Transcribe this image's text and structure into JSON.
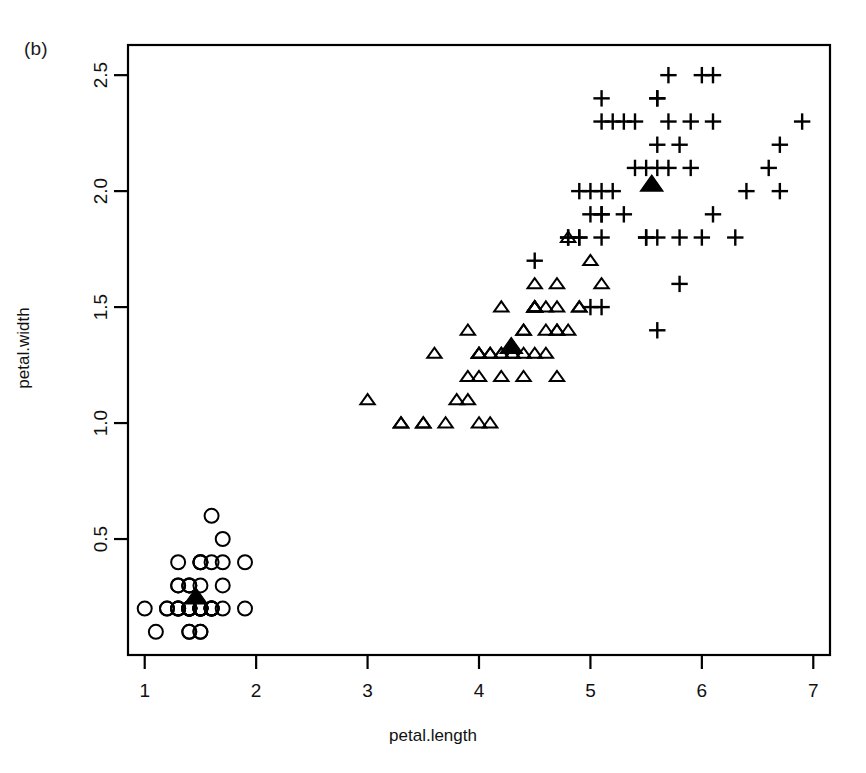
{
  "figure": {
    "panel_label": "(b)",
    "background_color": "#ffffff",
    "foreground_color": "#000000"
  },
  "chart_data": {
    "type": "scatter",
    "title": "",
    "subtitle": "",
    "panel_label": "(b)",
    "xlabel": "petal.length",
    "ylabel": "petal.width",
    "xlim": [
      0.85,
      7.15
    ],
    "ylim": [
      0.0,
      2.63
    ],
    "xticks": [
      1,
      2,
      3,
      4,
      5,
      6,
      7
    ],
    "xtick_labels": [
      "1",
      "2",
      "3",
      "4",
      "5",
      "6",
      "7"
    ],
    "yticks": [
      0.5,
      1.0,
      1.5,
      2.0,
      2.5
    ],
    "ytick_labels": [
      "0.5",
      "1.0",
      "1.5",
      "2.0",
      "2.5"
    ],
    "grid": false,
    "legend": false,
    "legend_position": "none",
    "frame": "box",
    "series": [
      {
        "name": "setosa",
        "marker": "circle-open",
        "color": "#000000",
        "points": [
          [
            1.4,
            0.2
          ],
          [
            1.4,
            0.2
          ],
          [
            1.3,
            0.2
          ],
          [
            1.5,
            0.2
          ],
          [
            1.4,
            0.2
          ],
          [
            1.7,
            0.4
          ],
          [
            1.4,
            0.3
          ],
          [
            1.5,
            0.2
          ],
          [
            1.4,
            0.2
          ],
          [
            1.5,
            0.1
          ],
          [
            1.5,
            0.2
          ],
          [
            1.6,
            0.2
          ],
          [
            1.4,
            0.1
          ],
          [
            1.1,
            0.1
          ],
          [
            1.2,
            0.2
          ],
          [
            1.5,
            0.4
          ],
          [
            1.3,
            0.4
          ],
          [
            1.4,
            0.3
          ],
          [
            1.7,
            0.3
          ],
          [
            1.5,
            0.3
          ],
          [
            1.7,
            0.2
          ],
          [
            1.5,
            0.4
          ],
          [
            1.0,
            0.2
          ],
          [
            1.7,
            0.5
          ],
          [
            1.9,
            0.2
          ],
          [
            1.6,
            0.2
          ],
          [
            1.6,
            0.4
          ],
          [
            1.5,
            0.2
          ],
          [
            1.4,
            0.2
          ],
          [
            1.6,
            0.2
          ],
          [
            1.6,
            0.2
          ],
          [
            1.5,
            0.4
          ],
          [
            1.5,
            0.1
          ],
          [
            1.4,
            0.2
          ],
          [
            1.5,
            0.2
          ],
          [
            1.2,
            0.2
          ],
          [
            1.3,
            0.2
          ],
          [
            1.4,
            0.1
          ],
          [
            1.3,
            0.2
          ],
          [
            1.5,
            0.2
          ],
          [
            1.3,
            0.3
          ],
          [
            1.3,
            0.3
          ],
          [
            1.3,
            0.2
          ],
          [
            1.6,
            0.6
          ],
          [
            1.9,
            0.4
          ],
          [
            1.4,
            0.3
          ],
          [
            1.6,
            0.2
          ],
          [
            1.4,
            0.2
          ],
          [
            1.5,
            0.2
          ],
          [
            1.4,
            0.2
          ]
        ],
        "centroid": [
          1.46,
          0.25
        ],
        "centroid_marker": "triangle-filled"
      },
      {
        "name": "versicolor",
        "marker": "triangle-open",
        "color": "#000000",
        "points": [
          [
            4.7,
            1.4
          ],
          [
            4.5,
            1.5
          ],
          [
            4.9,
            1.5
          ],
          [
            4.0,
            1.3
          ],
          [
            4.6,
            1.5
          ],
          [
            4.5,
            1.3
          ],
          [
            4.7,
            1.6
          ],
          [
            3.3,
            1.0
          ],
          [
            4.6,
            1.3
          ],
          [
            3.9,
            1.4
          ],
          [
            3.5,
            1.0
          ],
          [
            4.2,
            1.5
          ],
          [
            4.0,
            1.0
          ],
          [
            4.7,
            1.4
          ],
          [
            3.6,
            1.3
          ],
          [
            4.4,
            1.4
          ],
          [
            4.5,
            1.5
          ],
          [
            4.1,
            1.0
          ],
          [
            4.5,
            1.5
          ],
          [
            3.9,
            1.1
          ],
          [
            4.8,
            1.8
          ],
          [
            4.0,
            1.3
          ],
          [
            4.9,
            1.5
          ],
          [
            4.7,
            1.2
          ],
          [
            4.3,
            1.3
          ],
          [
            4.4,
            1.4
          ],
          [
            4.8,
            1.4
          ],
          [
            5.0,
            1.7
          ],
          [
            4.5,
            1.5
          ],
          [
            3.5,
            1.0
          ],
          [
            3.8,
            1.1
          ],
          [
            3.7,
            1.0
          ],
          [
            3.9,
            1.2
          ],
          [
            5.1,
            1.6
          ],
          [
            4.5,
            1.5
          ],
          [
            4.5,
            1.6
          ],
          [
            4.7,
            1.5
          ],
          [
            4.4,
            1.3
          ],
          [
            4.1,
            1.3
          ],
          [
            4.0,
            1.3
          ],
          [
            4.4,
            1.2
          ],
          [
            4.6,
            1.4
          ],
          [
            4.0,
            1.2
          ],
          [
            3.3,
            1.0
          ],
          [
            4.2,
            1.3
          ],
          [
            4.2,
            1.2
          ],
          [
            4.2,
            1.3
          ],
          [
            4.3,
            1.3
          ],
          [
            3.0,
            1.1
          ],
          [
            4.1,
            1.3
          ]
        ],
        "centroid": [
          4.29,
          1.33
        ],
        "centroid_marker": "triangle-filled"
      },
      {
        "name": "virginica",
        "marker": "plus",
        "color": "#000000",
        "points": [
          [
            6.0,
            2.5
          ],
          [
            5.1,
            1.9
          ],
          [
            5.9,
            2.1
          ],
          [
            5.6,
            1.8
          ],
          [
            5.8,
            2.2
          ],
          [
            6.6,
            2.1
          ],
          [
            4.5,
            1.7
          ],
          [
            6.3,
            1.8
          ],
          [
            5.8,
            1.8
          ],
          [
            6.1,
            2.5
          ],
          [
            5.1,
            2.0
          ],
          [
            5.3,
            1.9
          ],
          [
            5.5,
            2.1
          ],
          [
            5.0,
            2.0
          ],
          [
            5.1,
            2.4
          ],
          [
            5.3,
            2.3
          ],
          [
            5.5,
            1.8
          ],
          [
            6.7,
            2.2
          ],
          [
            6.9,
            2.3
          ],
          [
            5.0,
            1.5
          ],
          [
            5.7,
            2.3
          ],
          [
            4.9,
            2.0
          ],
          [
            6.7,
            2.0
          ],
          [
            4.9,
            1.8
          ],
          [
            5.7,
            2.1
          ],
          [
            6.0,
            1.8
          ],
          [
            4.8,
            1.8
          ],
          [
            4.9,
            1.8
          ],
          [
            5.6,
            2.1
          ],
          [
            5.8,
            1.6
          ],
          [
            6.1,
            1.9
          ],
          [
            6.4,
            2.0
          ],
          [
            5.6,
            2.2
          ],
          [
            5.1,
            1.5
          ],
          [
            5.6,
            1.4
          ],
          [
            6.1,
            2.3
          ],
          [
            5.6,
            2.4
          ],
          [
            5.5,
            1.8
          ],
          [
            4.8,
            1.8
          ],
          [
            5.4,
            2.1
          ],
          [
            5.6,
            2.4
          ],
          [
            5.1,
            2.3
          ],
          [
            5.1,
            1.9
          ],
          [
            5.9,
            2.3
          ],
          [
            5.7,
            2.5
          ],
          [
            5.2,
            2.3
          ],
          [
            5.0,
            1.9
          ],
          [
            5.2,
            2.0
          ],
          [
            5.4,
            2.3
          ],
          [
            5.1,
            1.8
          ]
        ],
        "centroid": [
          5.55,
          2.03
        ],
        "centroid_marker": "triangle-filled"
      }
    ]
  }
}
